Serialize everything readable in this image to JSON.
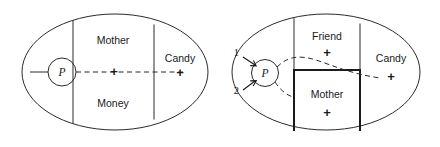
{
  "figure": {
    "type": "diagram",
    "caption": "",
    "background_color": "#ffffff",
    "line_color": "#2b2b2b",
    "text_color": "#1a1a1a",
    "panels": [
      {
        "id": "left-panel",
        "name": "left-diagram",
        "shape": "ellipse",
        "regions": [
          {
            "name": "mother-region",
            "label": "Mother"
          },
          {
            "name": "money-region",
            "label": "Money"
          },
          {
            "name": "candy-region",
            "label": "Candy"
          }
        ],
        "nodes": [
          {
            "name": "p-node",
            "label": "P"
          }
        ],
        "markers": [
          {
            "name": "center-plus",
            "label": "+"
          },
          {
            "name": "candy-plus",
            "label": "+"
          }
        ]
      },
      {
        "id": "right-panel",
        "name": "right-diagram",
        "shape": "ellipse",
        "regions": [
          {
            "name": "friend-region",
            "label": "Friend"
          },
          {
            "name": "mother-region",
            "label": "Mother"
          },
          {
            "name": "candy-region",
            "label": "Candy"
          }
        ],
        "nodes": [
          {
            "name": "p-node",
            "label": "P"
          }
        ],
        "arrow_labels": [
          {
            "name": "arrow-label-1",
            "label": "1"
          },
          {
            "name": "arrow-label-2",
            "label": "2"
          }
        ],
        "markers": [
          {
            "name": "friend-plus",
            "label": "+"
          },
          {
            "name": "mother-plus",
            "label": "+"
          },
          {
            "name": "candy-plus",
            "label": "+"
          }
        ]
      }
    ]
  }
}
